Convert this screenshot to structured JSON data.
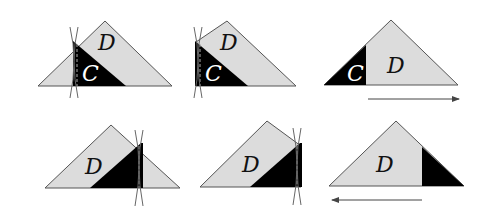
{
  "colors": {
    "light_region": "#dcdcdc",
    "dark_region": "#000000",
    "outline": "#555555",
    "label_on_light": "#111111",
    "label_on_dark": "#ffffff",
    "arrow": "#444444"
  },
  "labels": {
    "d": "D",
    "c": "C"
  },
  "panels": [
    {
      "id": 1,
      "labels": [
        "D",
        "C"
      ],
      "description": "triangle with dark piece C on left being cut along vertical line"
    },
    {
      "id": 2,
      "labels": [
        "D",
        "C"
      ],
      "description": "cut triangle, left part D with C"
    },
    {
      "id": 3,
      "labels": [
        "C",
        "D"
      ],
      "description": "rearranged: C at left, D, arrow pointing right"
    },
    {
      "id": 4,
      "labels": [
        "D"
      ],
      "description": "triangle with dark piece on right being cut along vertical line"
    },
    {
      "id": 5,
      "labels": [
        "D"
      ],
      "description": "cut triangle with dark piece on right"
    },
    {
      "id": 6,
      "labels": [
        "D"
      ],
      "description": "rearranged: dark piece at right, arrow pointing left"
    }
  ],
  "arrows": [
    {
      "panel": 3,
      "direction": "right"
    },
    {
      "panel": 6,
      "direction": "left"
    }
  ]
}
